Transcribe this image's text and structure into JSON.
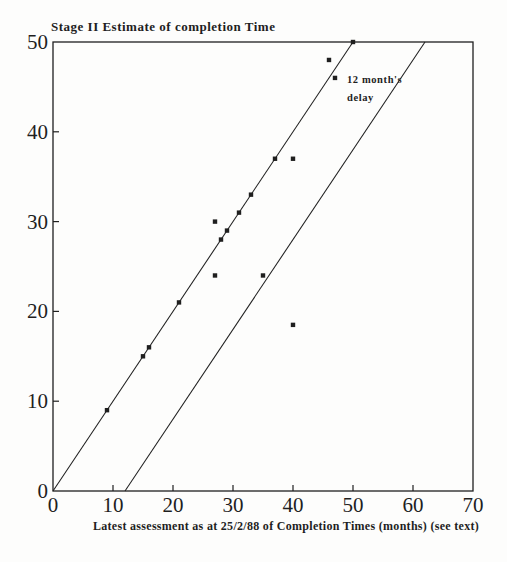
{
  "page": {
    "background": "#fdfdfc",
    "ink": "#1f1f1f"
  },
  "chart_data": {
    "type": "scatter",
    "title": "Stage II Estimate of completion Time",
    "xlabel": "Latest assessment as at 25/2/88 of Completion Times (months) (see text)",
    "ylabel": "",
    "xlim": [
      0,
      70
    ],
    "ylim": [
      0,
      50
    ],
    "xticks": [
      0,
      10,
      20,
      30,
      40,
      50,
      60,
      70
    ],
    "yticks": [
      0,
      10,
      20,
      30,
      40,
      50
    ],
    "grid": false,
    "legend": false,
    "marker": "filled-square",
    "points": [
      [
        9,
        9
      ],
      [
        15,
        15
      ],
      [
        16,
        16
      ],
      [
        21,
        21
      ],
      [
        27,
        24
      ],
      [
        27,
        30
      ],
      [
        28,
        28
      ],
      [
        29,
        29
      ],
      [
        31,
        31
      ],
      [
        33,
        33
      ],
      [
        35,
        24
      ],
      [
        37,
        37
      ],
      [
        40,
        18.5
      ],
      [
        40,
        37
      ],
      [
        46,
        48
      ],
      [
        47,
        46
      ],
      [
        50,
        50
      ]
    ],
    "lines": [
      {
        "name": "equality-line",
        "points": [
          [
            0,
            0
          ],
          [
            50,
            50
          ]
        ]
      },
      {
        "name": "delay-12-month-line",
        "points": [
          [
            12,
            0
          ],
          [
            62,
            50
          ]
        ]
      }
    ],
    "annotation": {
      "text_lines": [
        "12 month's",
        "delay"
      ],
      "x": 49,
      "y": 46
    }
  }
}
